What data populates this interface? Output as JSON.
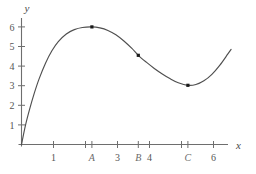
{
  "chart_data": {
    "type": "line",
    "title": "",
    "xlabel": "x",
    "ylabel": "y",
    "xlim": [
      0,
      6.6
    ],
    "ylim": [
      0,
      6.6
    ],
    "grid": false,
    "legend": "none",
    "x_ticks": [
      {
        "value": 1,
        "label": "1",
        "style": "number"
      },
      {
        "value": 2,
        "label": "",
        "style": "number"
      },
      {
        "value": 2.2,
        "label": "A",
        "style": "variable"
      },
      {
        "value": 3,
        "label": "3",
        "style": "number"
      },
      {
        "value": 3.65,
        "label": "B",
        "style": "variable"
      },
      {
        "value": 4,
        "label": "4",
        "style": "number"
      },
      {
        "value": 5,
        "label": "",
        "style": "number"
      },
      {
        "value": 5.2,
        "label": "C",
        "style": "variable"
      },
      {
        "value": 6,
        "label": "6",
        "style": "number"
      }
    ],
    "y_ticks": [
      {
        "value": 1,
        "label": "1"
      },
      {
        "value": 2,
        "label": "2"
      },
      {
        "value": 3,
        "label": "3"
      },
      {
        "value": 4,
        "label": "4"
      },
      {
        "value": 5,
        "label": "5"
      },
      {
        "value": 6,
        "label": "6"
      }
    ],
    "series": [
      {
        "name": "curve",
        "color": "#4f4f4f",
        "points": [
          [
            0.0,
            0.0
          ],
          [
            0.12,
            0.95
          ],
          [
            0.25,
            1.78
          ],
          [
            0.4,
            2.62
          ],
          [
            0.55,
            3.35
          ],
          [
            0.75,
            4.15
          ],
          [
            0.95,
            4.78
          ],
          [
            1.15,
            5.25
          ],
          [
            1.4,
            5.64
          ],
          [
            1.65,
            5.86
          ],
          [
            1.9,
            5.97
          ],
          [
            2.2,
            6.0
          ],
          [
            2.45,
            5.95
          ],
          [
            2.7,
            5.82
          ],
          [
            2.95,
            5.6
          ],
          [
            3.2,
            5.28
          ],
          [
            3.45,
            4.9
          ],
          [
            3.65,
            4.55
          ],
          [
            3.9,
            4.2
          ],
          [
            4.15,
            3.88
          ],
          [
            4.4,
            3.6
          ],
          [
            4.65,
            3.35
          ],
          [
            4.9,
            3.15
          ],
          [
            5.2,
            3.02
          ],
          [
            5.45,
            3.06
          ],
          [
            5.7,
            3.25
          ],
          [
            5.95,
            3.58
          ],
          [
            6.2,
            4.05
          ],
          [
            6.45,
            4.62
          ],
          [
            6.55,
            4.85
          ]
        ]
      }
    ],
    "marked_points": [
      {
        "name": "local-maximum",
        "x": 2.2,
        "y": 6.0
      },
      {
        "name": "inflection",
        "x": 3.65,
        "y": 4.55
      },
      {
        "name": "local-minimum",
        "x": 5.2,
        "y": 3.02
      }
    ],
    "axis_color": "#6e6e6e",
    "curve_color": "#4f4f4f",
    "point_color": "#1a1a1a"
  }
}
